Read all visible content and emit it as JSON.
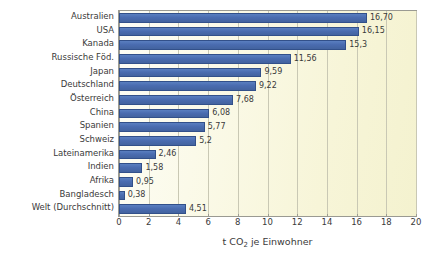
{
  "chart_data": {
    "type": "bar",
    "orientation": "horizontal",
    "title": "",
    "xlabel": "t CO2 je Einwohner",
    "xlabel_parts": {
      "pre": "t CO",
      "sub": "2",
      "post": " je Einwohner"
    },
    "ylabel": "",
    "xlim": [
      0,
      20
    ],
    "xticks": [
      0,
      2,
      4,
      6,
      8,
      10,
      12,
      14,
      16,
      18,
      20
    ],
    "grid": "vertical",
    "legend": "none",
    "bar_color": "#4a6cb0",
    "plot_bg_start": "#fdfdf6",
    "plot_bg_end": "#f4f2cf",
    "categories": [
      "Australien",
      "USA",
      "Kanada",
      "Russische Föd.",
      "Japan",
      "Deutschland",
      "Österreich",
      "China",
      "Spanien",
      "Schweiz",
      "Lateinamerika",
      "Indien",
      "Afrika",
      "Bangladesch",
      "Welt (Durchschnitt)"
    ],
    "values": [
      16.7,
      16.15,
      15.3,
      11.56,
      9.59,
      9.22,
      7.68,
      6.08,
      5.77,
      5.2,
      2.46,
      1.58,
      0.95,
      0.38,
      4.51
    ],
    "value_labels": [
      "16,70",
      "16,15",
      "15,3",
      "11,56",
      "9,59",
      "9,22",
      "7,68",
      "6,08",
      "5,77",
      "5,2",
      "2,46",
      "1,58",
      "0,95",
      "0,38",
      "4,51"
    ]
  }
}
